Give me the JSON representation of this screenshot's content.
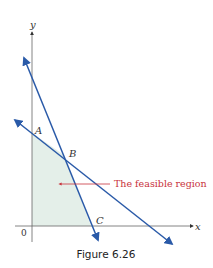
{
  "figure": {
    "caption": "Figure 6.26",
    "axes": {
      "x_label": "x",
      "y_label": "y",
      "origin_label": "0"
    },
    "points": [
      {
        "name": "A",
        "label": "A"
      },
      {
        "name": "B",
        "label": "B"
      },
      {
        "name": "C",
        "label": "C"
      }
    ],
    "annotation": "The feasible region",
    "colors": {
      "line": "#2a5aa8",
      "region": "#e4efe9",
      "annotation": "#c8323c",
      "axis": "#555555"
    }
  }
}
